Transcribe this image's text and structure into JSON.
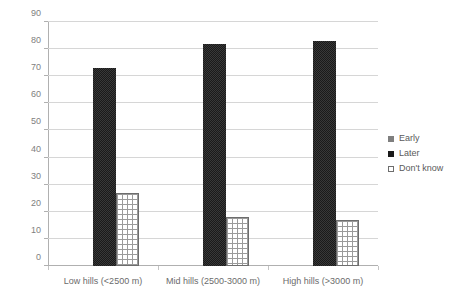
{
  "chart_data": {
    "type": "bar",
    "title": "",
    "subtitle": "",
    "xlabel": "",
    "ylabel": "",
    "ylim": [
      0,
      90
    ],
    "ytick_step": 10,
    "yticks": [
      0,
      10,
      20,
      30,
      40,
      50,
      60,
      70,
      80,
      90
    ],
    "ytick_labels": [
      "0",
      "10",
      "20",
      "30",
      "40",
      "50",
      "60",
      "70",
      "80",
      "90"
    ],
    "grid": true,
    "legend_position": "right",
    "categories": [
      "Low hills (<2500 m)",
      "Mid hills (2500-3000 m)",
      "High hills (>3000 m)"
    ],
    "series": [
      {
        "name": "Early",
        "values": [
          0,
          0,
          0
        ],
        "color": "#7f7f7f"
      },
      {
        "name": "Later",
        "values": [
          73,
          82,
          83
        ],
        "color": "#1a1a1a"
      },
      {
        "name": "Don't know",
        "values": [
          27,
          18,
          17
        ],
        "color": "#ffffff"
      }
    ]
  },
  "legend": {
    "items": [
      {
        "label": "Early",
        "swatch": "legend-swatch-early"
      },
      {
        "label": "Later",
        "swatch": "legend-swatch-later"
      },
      {
        "label": "Don't know",
        "swatch": "legend-swatch-dontknow"
      }
    ]
  }
}
